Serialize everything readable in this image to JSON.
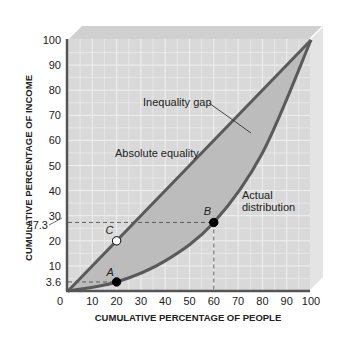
{
  "chart_data": {
    "type": "line",
    "title": "",
    "xlabel": "CUMULATIVE PERCENTAGE OF PEOPLE",
    "ylabel": "CUMULATIVE PERCENTAGE OF INCOME",
    "xlim": [
      0,
      100
    ],
    "ylim": [
      0,
      100
    ],
    "grid": true,
    "x_ticks": [
      "0",
      "10",
      "20",
      "30",
      "40",
      "50",
      "60",
      "70",
      "80",
      "90",
      "100"
    ],
    "y_ticks": [
      "0",
      "10",
      "20",
      "30",
      "40",
      "50",
      "60",
      "70",
      "80",
      "90",
      "100"
    ],
    "y_extra_ticks": [
      "3.6",
      "27.3"
    ],
    "series": [
      {
        "name": "Absolute equality",
        "x": [
          0,
          100
        ],
        "y": [
          0,
          100
        ]
      },
      {
        "name": "Actual distribution",
        "x": [
          0,
          20,
          40,
          60,
          80,
          100
        ],
        "y": [
          0,
          3.6,
          12,
          27.3,
          55,
          100
        ]
      }
    ],
    "points": [
      {
        "label": "A",
        "x": 20,
        "y": 3.6,
        "fill": "black"
      },
      {
        "label": "B",
        "x": 60,
        "y": 27.3,
        "fill": "black"
      },
      {
        "label": "C",
        "x": 20,
        "y": 20,
        "fill": "white"
      }
    ],
    "annotations": [
      {
        "text": "Inequality gap",
        "target": "shaded area between lines"
      },
      {
        "text": "Absolute equality",
        "target": "diagonal line"
      },
      {
        "text": "Actual",
        "target": "curve"
      },
      {
        "text": "distribution",
        "target": "curve"
      }
    ],
    "colors": {
      "plot_bg": "#d9d9d9",
      "gap_fill": "#bdbdbd",
      "line": "#5a5a5a",
      "grid": "#f2f2f2",
      "box_top": "#cfcfcf",
      "box_side": "#e3e3e3"
    }
  }
}
